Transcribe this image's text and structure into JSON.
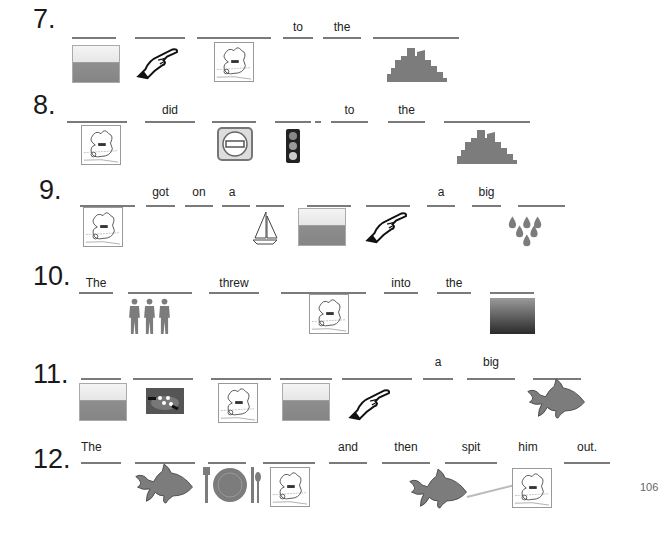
{
  "page_number": "106",
  "colors": {
    "blank_line": "#7a7a7a",
    "icon_gray": "#808080",
    "text": "#222222"
  },
  "exercises": [
    {
      "number": "7.",
      "words": [
        "",
        "",
        "",
        "to",
        "the",
        ""
      ],
      "pictures": [
        "sea-icon",
        "pointing-hand-icon",
        "jonah-icon",
        "city-skyline-icon"
      ]
    },
    {
      "number": "8.",
      "words": [
        "",
        "did",
        "",
        "",
        "to",
        "the",
        ""
      ],
      "pictures": [
        "jonah-icon",
        "no-entry-sign-icon",
        "traffic-light-icon",
        "city-skyline-icon"
      ]
    },
    {
      "number": "9.",
      "words": [
        "",
        "got",
        "on",
        "a",
        "",
        "",
        "",
        "a",
        "big",
        ""
      ],
      "pictures": [
        "jonah-icon",
        "sailboat-icon",
        "sea-icon",
        "pointing-hand-icon",
        "raindrops-icon"
      ]
    },
    {
      "number": "10.",
      "words": [
        "The",
        "",
        "threw",
        "",
        "into",
        "the",
        ""
      ],
      "pictures": [
        "three-men-icon",
        "jonah-icon",
        "dark-sea-icon"
      ]
    },
    {
      "number": "11.",
      "words": [
        "",
        "",
        "",
        "",
        "",
        "a",
        "big",
        ""
      ],
      "pictures": [
        "sea-icon",
        "storm-icon",
        "jonah-icon",
        "sea-icon",
        "pointing-hand-icon",
        "fish-icon"
      ]
    },
    {
      "number": "12.",
      "words": [
        "The",
        "",
        "",
        "",
        "and",
        "then",
        "spit",
        "him",
        "out."
      ],
      "pictures": [
        "fish-icon",
        "plate-cutlery-icon",
        "jonah-icon",
        "fish-icon",
        "jonah-icon"
      ]
    }
  ]
}
